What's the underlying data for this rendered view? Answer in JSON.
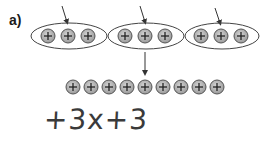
{
  "label": "a)",
  "groups": [
    {
      "chips": 3,
      "sign": "+"
    },
    {
      "chips": 3,
      "sign": "+"
    },
    {
      "chips": 3,
      "sign": "+"
    }
  ],
  "combined_row": {
    "chips": 9,
    "sign": "+"
  },
  "handwritten_expression": "+3x+3",
  "colors": {
    "chip_fill": "#b8b8b8",
    "outline": "#444444",
    "text": "#3a3a3a"
  }
}
